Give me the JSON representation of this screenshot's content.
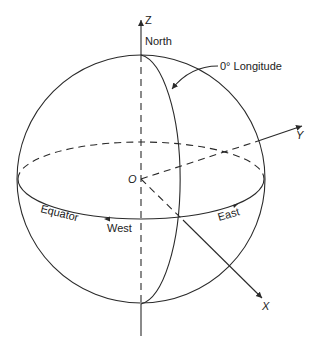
{
  "figure": {
    "axes": {
      "z": "Z",
      "y": "Y",
      "x": "X",
      "origin": "O"
    },
    "labels": {
      "north": "North",
      "longitude": "0° Longitude",
      "equator": "Equator",
      "west": "West",
      "east": "East"
    },
    "colors": {
      "line": "#2a2a2a",
      "background": "#ffffff"
    }
  }
}
